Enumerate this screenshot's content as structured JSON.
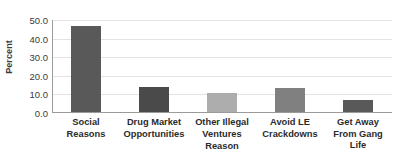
{
  "chart_data": {
    "type": "bar",
    "title": "",
    "subtitle": "",
    "xlabel": "Reason",
    "ylabel": "Percent",
    "categories": [
      "Social Reasons",
      "Drug Market Opportunities",
      "Other Illegal Ventures",
      "Avoid LE Crackdowns",
      "Get Away From Gang Life"
    ],
    "category_lines": [
      [
        "Social Reasons",
        ""
      ],
      [
        "Drug Market",
        "Opportunities"
      ],
      [
        "Other Illegal",
        "Ventures"
      ],
      [
        "Avoid LE",
        "Crackdowns"
      ],
      [
        "Get Away",
        "From Gang Life"
      ]
    ],
    "values": [
      46.5,
      13.5,
      10.3,
      13.0,
      6.5
    ],
    "bar_colors": [
      "#595959",
      "#4a4a4a",
      "#adadad",
      "#808080",
      "#595959"
    ],
    "ylim": [
      0,
      50
    ],
    "ytick_labels": [
      "50.0",
      "40.0",
      "30.0",
      "20.0",
      "10.0",
      "0.0"
    ],
    "ytick_values": [
      50,
      40,
      30,
      20,
      10,
      0
    ],
    "grid": true,
    "gridlines": "horizontal",
    "legend": "none",
    "annotations": []
  },
  "colors": {
    "background": "#ffffff",
    "gridline": "#e3e3e3",
    "axis": "#9a9a9a",
    "text": "#2b2b2b",
    "tick_text": "#3a3a3a"
  }
}
